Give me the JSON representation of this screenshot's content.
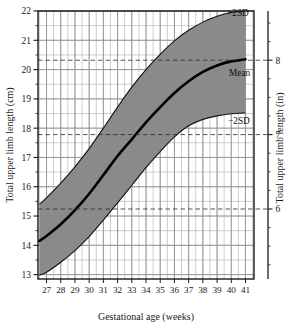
{
  "chart_data": {
    "type": "area",
    "title": "",
    "subtitle": "",
    "xlabel": "Gestational age (weeks)",
    "ylabel": "Total upper limb length (cm)",
    "ylabel_secondary": "Total upper limb length (in)",
    "xlim": [
      26.4,
      41.6
    ],
    "ylim": [
      12.85,
      22.0
    ],
    "ylim_secondary": [
      5.0,
      8.66
    ],
    "grid": true,
    "grid_major_y_step": 1,
    "grid_minor_y_step": 0.5,
    "grid_minor_x_step": 0.5,
    "legend_position": "inline-right-annotations",
    "x_tick_labels": [
      "27",
      "28",
      "29",
      "30",
      "31",
      "32",
      "33",
      "34",
      "35",
      "36",
      "37",
      "38",
      "39",
      "40",
      "41"
    ],
    "y_tick_labels_cm": [
      "22",
      "21",
      "20",
      "19",
      "18",
      "17",
      "16",
      "15",
      "14",
      "13"
    ],
    "y_tick_labels_in": [
      "8",
      "7",
      "6",
      "5"
    ],
    "x": [
      26.5,
      27,
      28,
      29,
      30,
      31,
      32,
      33,
      34,
      35,
      36,
      37,
      38,
      39,
      40,
      41
    ],
    "series": [
      {
        "name": "+2SD",
        "label": "+2SD",
        "values": [
          15.4,
          15.62,
          16.12,
          16.68,
          17.3,
          18.0,
          18.72,
          19.4,
          20.0,
          20.52,
          20.98,
          21.34,
          21.62,
          21.82,
          21.95,
          22.0
        ]
      },
      {
        "name": "Mean",
        "label": "Mean",
        "values": [
          14.15,
          14.32,
          14.72,
          15.2,
          15.76,
          16.4,
          17.05,
          17.62,
          18.2,
          18.72,
          19.2,
          19.6,
          19.92,
          20.14,
          20.28,
          20.35
        ]
      },
      {
        "name": "-2SD",
        "label": "−2SD",
        "values": [
          12.98,
          13.08,
          13.42,
          13.82,
          14.3,
          14.86,
          15.45,
          16.05,
          16.65,
          17.2,
          17.7,
          18.08,
          18.3,
          18.42,
          18.49,
          18.52
        ]
      }
    ],
    "reference_lines_cm": [
      20.32,
      17.78,
      15.24
    ],
    "reference_lines_in": [
      8,
      7,
      6
    ],
    "band_fill_color": "#8a8a8a",
    "mean_line_color": "#000000",
    "grid_color": "#8f8f8f",
    "frame_color": "#1a1a1a"
  },
  "annotations": {
    "plus2sd": "+2SD",
    "mean": "Mean",
    "minus2sd": "−2SD"
  },
  "axes": {
    "x_title": "Gestational age (weeks)",
    "y_left_title": "Total upper limb length (cm)",
    "y_right_title": "Total upper limb length (in)"
  }
}
